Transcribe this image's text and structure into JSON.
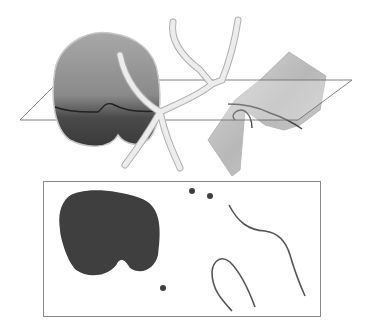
{
  "diagram": {
    "colors": {
      "background": "#ffffff",
      "blob_light": "#9a9a9a",
      "blob_dark": "#3a3a3a",
      "tube": "#e6e6e6",
      "tube_edge": "#b0b0b0",
      "surface": "#c4c4c4",
      "plane_edge": "#555555",
      "section_fill": "#3f3f3f",
      "section_line": "#555555",
      "frame": "#888888"
    },
    "top_view": {
      "objects": [
        "solid-blob",
        "branching-tube",
        "curved-surface",
        "cutting-plane"
      ]
    },
    "bottom_view": {
      "objects": [
        "blob-cross-section",
        "tube-points",
        "surface-curves",
        "section-frame"
      ]
    }
  }
}
